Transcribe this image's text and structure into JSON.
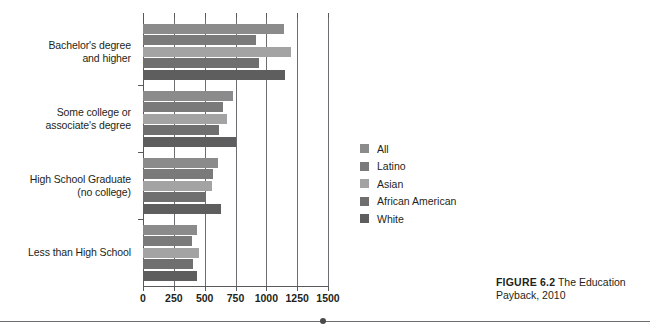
{
  "chart_data": {
    "type": "bar",
    "orientation": "horizontal",
    "title": "",
    "xlabel": "",
    "ylabel": "",
    "xlim": [
      0,
      1500
    ],
    "xticks": [
      0,
      250,
      500,
      750,
      1000,
      1250,
      1500
    ],
    "xtick_labels": [
      "0",
      "250",
      "500",
      "750",
      "1000",
      "1250",
      "1500"
    ],
    "grid": true,
    "grid_axis": "x",
    "legend_position": "right",
    "categories": [
      "Bachelor's degree and higher",
      "Some college or associate's degree",
      "High School Graduate (no college)",
      "Less than High School"
    ],
    "category_lines": [
      [
        "Bachelor's degree",
        "and higher"
      ],
      [
        "Some college or",
        "associate's degree"
      ],
      [
        "High School Graduate",
        "(no college)"
      ],
      [
        "Less than High School"
      ]
    ],
    "series": [
      {
        "name": "All",
        "color": "#8b8b8b",
        "values": [
          1140,
          730,
          610,
          435
        ]
      },
      {
        "name": "Latino",
        "color": "#7a7a7a",
        "values": [
          920,
          650,
          570,
          395
        ]
      },
      {
        "name": "Asian",
        "color": "#a3a3a3",
        "values": [
          1200,
          680,
          560,
          450
        ]
      },
      {
        "name": "African American",
        "color": "#6f6f6f",
        "values": [
          940,
          615,
          510,
          405
        ]
      },
      {
        "name": "White",
        "color": "#5e5e5e",
        "values": [
          1150,
          750,
          630,
          435
        ]
      }
    ]
  },
  "legend": {
    "items": [
      {
        "label": "All",
        "color": "#8b8b8b"
      },
      {
        "label": "Latino",
        "color": "#7a7a7a"
      },
      {
        "label": "Asian",
        "color": "#a3a3a3"
      },
      {
        "label": "African American",
        "color": "#6f6f6f"
      },
      {
        "label": "White",
        "color": "#5e5e5e"
      }
    ]
  },
  "caption": {
    "figure_number": "FIGURE 6.2",
    "text_part_one": " The",
    "text_part_two": "Education Payback, 2010"
  }
}
